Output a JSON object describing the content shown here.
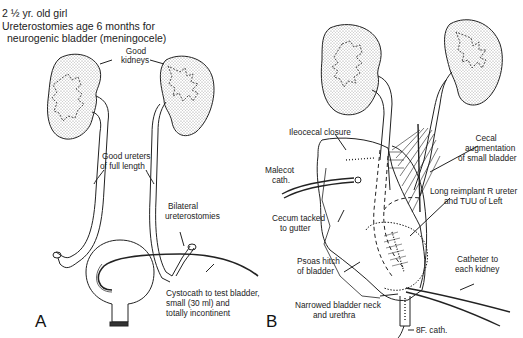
{
  "figure": {
    "panel_a": {
      "letter": "A",
      "header": {
        "line1": "2 ½ yr. old girl",
        "line2": "Ureterostomies age 6 months for",
        "line3": "neurogenic bladder (meningocele)"
      },
      "labels": {
        "good_kidneys_1": "Good",
        "good_kidneys_2": "kidneys",
        "good_ureters_1": "Good ureters",
        "good_ureters_2": "of full length",
        "bilateral_1": "Bilateral",
        "bilateral_2": "ureterostomies",
        "cystocath_1": "Cystocath to test bladder,",
        "cystocath_2": "small (30 ml) and",
        "cystocath_3": "totally incontinent"
      }
    },
    "panel_b": {
      "letter": "B",
      "labels": {
        "ileocecal": "Ileocecal closure",
        "cecal_1": "Cecal",
        "cecal_2": "augmentation",
        "cecal_3": "of small bladder",
        "malecot_1": "Malecot",
        "malecot_2": "cath.",
        "reimplant_1": "Long reimplant R ureter",
        "reimplant_2": "and TUU of Left",
        "cecum_1": "Cecum tacked",
        "cecum_2": "to gutter",
        "catheter_1": "Catheter to",
        "catheter_2": "each kidney",
        "psoas_1": "Psoas hitch",
        "psoas_2": "of bladder",
        "neck_1": "Narrowed bladder neck",
        "neck_2": "and urethra",
        "bf_cath": "8F. cath."
      }
    }
  }
}
